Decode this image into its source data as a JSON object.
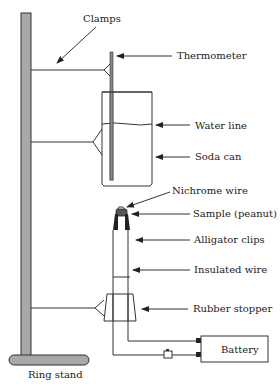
{
  "diagram": {
    "labels": {
      "clamps": "Clamps",
      "thermometer": "Thermometer",
      "water_line": "Water line",
      "soda_can": "Soda can",
      "nichrome_wire": "Nichrome wire",
      "sample": "Sample (peanut)",
      "alligator_clips": "Alligator clips",
      "insulated_wire": "Insulated wire",
      "rubber_stopper": "Rubber stopper",
      "battery": "Battery",
      "ring_stand": "Ring stand"
    },
    "colors": {
      "stand_fill": "#a8a8a8",
      "line": "#333333",
      "thermometer": "#888888",
      "can_fill": "#ffffff"
    }
  }
}
